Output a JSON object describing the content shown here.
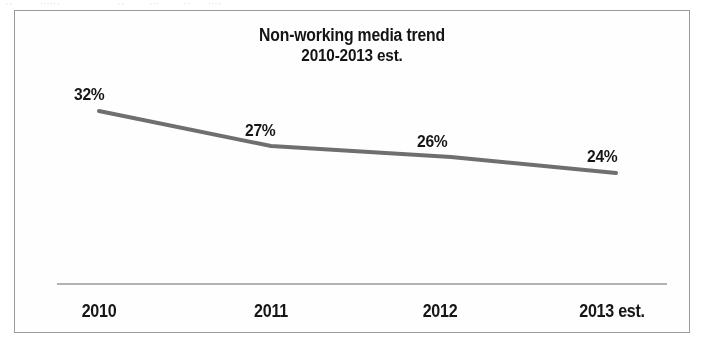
{
  "scan_artifact": {
    "fragments": [
      {
        "text": "··",
        "left": 6
      },
      {
        "text": "······",
        "left": 40
      },
      {
        "text": "··",
        "left": 118
      },
      {
        "text": "···",
        "left": 150
      },
      {
        "text": "··",
        "left": 184
      },
      {
        "text": "····",
        "left": 208
      }
    ]
  },
  "chart_data": {
    "type": "line",
    "title": "Non-working media trend",
    "subtitle": "2010-2013 est.",
    "xlabel": "",
    "ylabel": "",
    "categories": [
      "2010",
      "2011",
      "2012",
      "2013 est."
    ],
    "values": [
      32,
      26.5,
      26,
      24
    ],
    "value_labels": [
      "32%",
      "27%",
      "26%",
      "24%"
    ],
    "series": [
      {
        "name": "Non-working media",
        "values": [
          32,
          26.5,
          26,
          24
        ],
        "labels": [
          "32%",
          "27%",
          "26%",
          "24%"
        ],
        "color": "#6f6f6f"
      }
    ],
    "ylim": [
      0,
      40
    ],
    "grid": false,
    "legend": false,
    "legend_position": "none",
    "axis_line_color": "#9a9a9a",
    "line_color": "#6f6f6f",
    "line_width": 4,
    "text_color": "#161616",
    "frame_color": "#9b9b9b",
    "background": "#fefefe",
    "points_px": [
      {
        "x": 84,
        "y": 100
      },
      {
        "x": 256,
        "y": 135
      },
      {
        "x": 436,
        "y": 146
      },
      {
        "x": 601,
        "y": 162
      }
    ],
    "value_label_px": [
      {
        "x": 59,
        "y": 74
      },
      {
        "x": 230,
        "y": 110
      },
      {
        "x": 402,
        "y": 121
      },
      {
        "x": 572,
        "y": 136
      }
    ],
    "category_label_px": [
      {
        "x": 84,
        "y": 290
      },
      {
        "x": 256,
        "y": 290
      },
      {
        "x": 425,
        "y": 290
      },
      {
        "x": 597,
        "y": 290
      }
    ],
    "axis_rule_px": {
      "x1": 42,
      "x2": 652,
      "y": 273
    }
  }
}
